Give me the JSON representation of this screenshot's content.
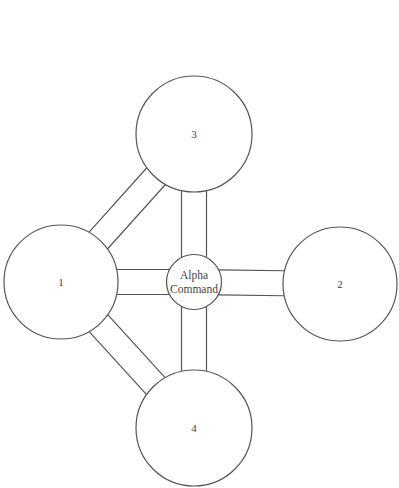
{
  "diagram": {
    "type": "network",
    "hub": {
      "id": "alpha",
      "label_lines": [
        "Alpha",
        "Command"
      ]
    },
    "nodes": [
      {
        "id": "n1",
        "label": "1"
      },
      {
        "id": "n2",
        "label": "2"
      },
      {
        "id": "n3",
        "label": "3"
      },
      {
        "id": "n4",
        "label": "4"
      }
    ],
    "connections": [
      {
        "from": "n1",
        "to": "alpha"
      },
      {
        "from": "n2",
        "to": "alpha"
      },
      {
        "from": "n3",
        "to": "alpha"
      },
      {
        "from": "n4",
        "to": "alpha"
      },
      {
        "from": "n1",
        "to": "n3"
      },
      {
        "from": "n1",
        "to": "n4"
      }
    ],
    "colors": {
      "stroke": "#555555",
      "fill": "#ffffff",
      "text": "#444444"
    }
  }
}
